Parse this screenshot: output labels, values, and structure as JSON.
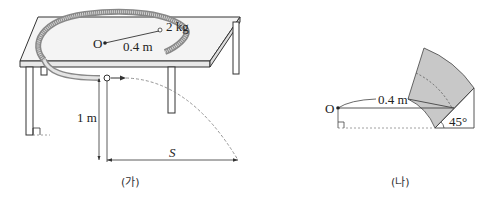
{
  "figure_a": {
    "caption": "(가)",
    "mass_label": "2 kg",
    "center_label": "O",
    "radius_label": "0.4 m",
    "height_label": "1 m",
    "distance_label": "S"
  },
  "figure_b": {
    "caption": "(나)",
    "center_label": "O",
    "radius_label": "0.4 m",
    "angle_label": "45°"
  },
  "colors": {
    "line": "#333333",
    "table_top": "#f2f2f2",
    "track_fill": "#bdbdbd",
    "sector_fill": "#c8c8c8",
    "dashed": "#888888"
  }
}
